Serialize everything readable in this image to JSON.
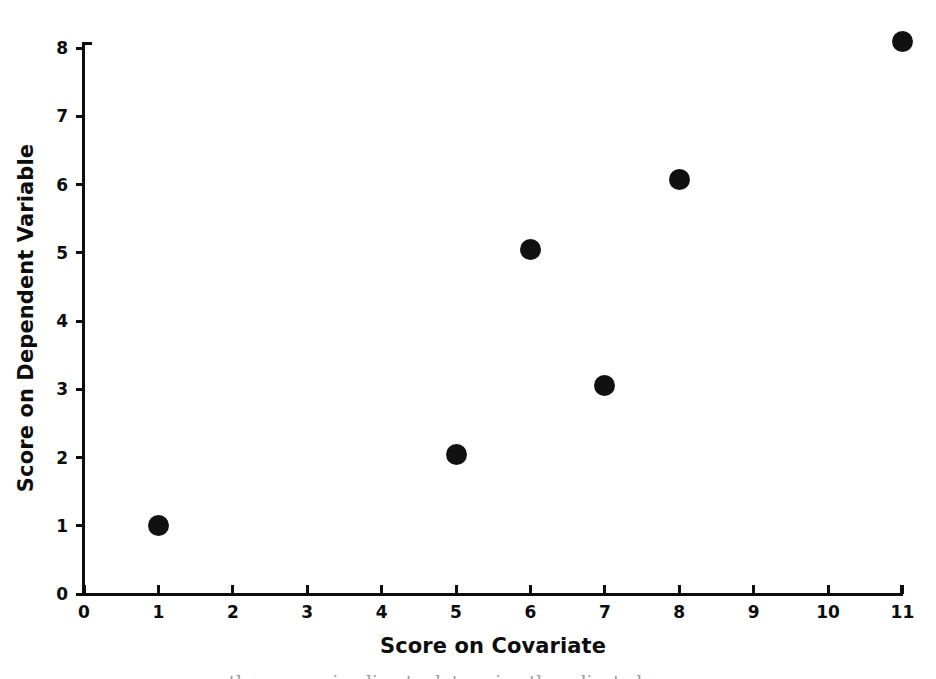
{
  "chart_data": {
    "type": "scatter",
    "title": "",
    "xlabel": "Score on Covariate",
    "ylabel": "Score on Dependent Variable",
    "xlim": [
      0,
      11
    ],
    "ylim": [
      0,
      8
    ],
    "x_ticks": [
      "0",
      "1",
      "2",
      "3",
      "4",
      "5",
      "6",
      "7",
      "8",
      "9",
      "10",
      "11"
    ],
    "y_ticks": [
      "0",
      "1",
      "2",
      "3",
      "4",
      "5",
      "6",
      "7",
      "8"
    ],
    "grid": false,
    "legend": null,
    "marker": {
      "shape": "circle",
      "color": "#111111",
      "size_px": 21
    },
    "points": [
      {
        "x": 1,
        "y": 1.0
      },
      {
        "x": 5,
        "y": 2.05
      },
      {
        "x": 6,
        "y": 5.05
      },
      {
        "x": 7,
        "y": 3.05
      },
      {
        "x": 8,
        "y": 6.07
      },
      {
        "x": 11,
        "y": 8.1
      }
    ],
    "series": [
      {
        "name": "observations",
        "x": [
          1,
          5,
          6,
          7,
          8,
          11
        ],
        "values": [
          1.0,
          2.05,
          5.05,
          3.05,
          6.07,
          8.1
        ]
      }
    ],
    "axis_color": "#0d0d0d",
    "background": "#ffffff"
  },
  "figure": {
    "bottom_caption_bleed": "the regression line to determine the adjusted means"
  }
}
